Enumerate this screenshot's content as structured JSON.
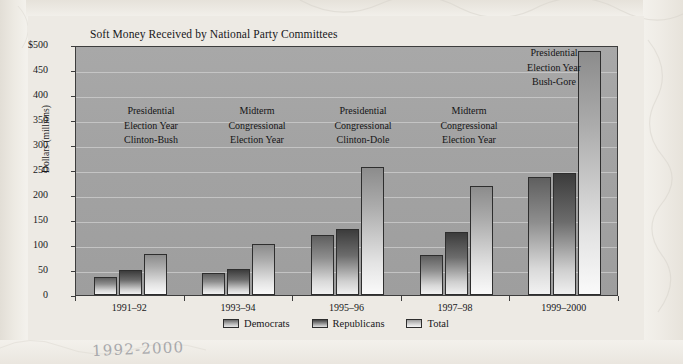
{
  "chart_data": {
    "type": "bar",
    "title": "Soft Money Received by National Party Committees",
    "xlabel": "",
    "ylabel": "Dollars (millions)",
    "ylim": [
      0,
      500
    ],
    "grid": true,
    "legend_position": "bottom",
    "categories": [
      "1991–92",
      "1993–94",
      "1995–96",
      "1997–98",
      "1999–2000"
    ],
    "ytick_labels": [
      "$500",
      "450",
      "400",
      "350",
      "300",
      "250",
      "200",
      "150",
      "100",
      "50",
      "0"
    ],
    "ytick_values": [
      500,
      450,
      400,
      350,
      300,
      250,
      200,
      150,
      100,
      50,
      0
    ],
    "series": [
      {
        "name": "Democrats",
        "values": [
          36,
          45,
          120,
          81,
          236
        ]
      },
      {
        "name": "Republicans",
        "values": [
          50,
          53,
          132,
          126,
          244
        ]
      },
      {
        "name": "Total",
        "values": [
          83,
          102,
          257,
          219,
          488
        ]
      }
    ],
    "annotations": [
      {
        "group": "1991–92",
        "lines": [
          "Presidential",
          "Election Year",
          "Clinton-Bush"
        ]
      },
      {
        "group": "1993–94",
        "lines": [
          "Midterm",
          "Congressional",
          "Election Year"
        ]
      },
      {
        "group": "1995–96",
        "lines": [
          "Presidential",
          "Congressional",
          "Clinton-Dole"
        ]
      },
      {
        "group": "1997–98",
        "lines": [
          "Midterm",
          "Congressional",
          "Election Year"
        ]
      },
      {
        "group": "1999–2000",
        "lines": [
          "Presidential",
          "Election Year",
          "Bush-Gore"
        ]
      }
    ]
  },
  "annotation_text": {
    "g1_l1": "Presidential",
    "g1_l2": "Election Year",
    "g1_l3": "Clinton-Bush",
    "g2_l1": "Midterm",
    "g2_l2": "Congressional",
    "g2_l3": "Election Year",
    "g3_l1": "Presidential",
    "g3_l2": "Congressional",
    "g3_l3": "Clinton-Dole",
    "g4_l1": "Midterm",
    "g4_l2": "Congressional",
    "g4_l3": "Election Year",
    "g5_l1": "Presidential",
    "g5_l2": "Election Year",
    "g5_l3": "Bush-Gore"
  },
  "legend": {
    "items": [
      {
        "label": "Democrats"
      },
      {
        "label": "Republicans"
      },
      {
        "label": "Total"
      }
    ]
  },
  "margin_note": {
    "handwritten": "1992-2000"
  },
  "colors": {
    "plot_background": "#a3a3a3",
    "page_background": "#f3f1ec",
    "figure_background": "#edeae4",
    "gridline": "#cfcfcf",
    "axis": "#3d3d3d",
    "text": "#17171a",
    "democrats": "#8e8e8e",
    "republicans": "#6c6c6c",
    "total": "#d2d2d2",
    "handwriting": "#8d8f96"
  }
}
